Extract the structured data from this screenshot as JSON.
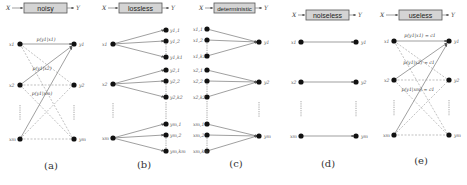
{
  "figure": {
    "input_symbol": "X",
    "output_symbol": "Y",
    "panels": [
      {
        "id": "a",
        "caption": "(a)",
        "channel_label": "noisy",
        "inputs": [
          "x1",
          "x2",
          "xm"
        ],
        "outputs": [
          "y1",
          "y2",
          "ym"
        ],
        "probability_labels": [
          "p(y1|x1)",
          "p(y1|x2)",
          "p(y1|xm)"
        ]
      },
      {
        "id": "b",
        "caption": "(b)",
        "channel_label": "lossless",
        "inputs": [
          "x1",
          "x2",
          "xm"
        ],
        "outputs": [
          "y1,1",
          "y1,2",
          "y1,k1",
          "y2,1",
          "y2,2",
          "y2,k2",
          "ym,1",
          "ym,2",
          "ym,km"
        ]
      },
      {
        "id": "c",
        "caption": "(c)",
        "channel_label": "deterministic",
        "inputs": [
          "x1,1",
          "x1,2",
          "x1,k1",
          "x2,1",
          "x2,2",
          "x2,k2",
          "xm,1",
          "xm,2",
          "xm,km"
        ],
        "outputs": [
          "y1",
          "y2",
          "ym"
        ]
      },
      {
        "id": "d",
        "caption": "(d)",
        "channel_label": "noiseless",
        "inputs": [
          "x1",
          "x2",
          "xm"
        ],
        "outputs": [
          "y1",
          "y2",
          "ym"
        ]
      },
      {
        "id": "e",
        "caption": "(e)",
        "channel_label": "useless",
        "inputs": [
          "x1",
          "x2",
          "xm"
        ],
        "outputs": [
          "y1",
          "y2",
          "ym"
        ],
        "probability_labels": [
          "p(y1|x1) = c1",
          "p(y1|x2) = c1",
          "p(y1|xm) = c1"
        ]
      }
    ]
  }
}
